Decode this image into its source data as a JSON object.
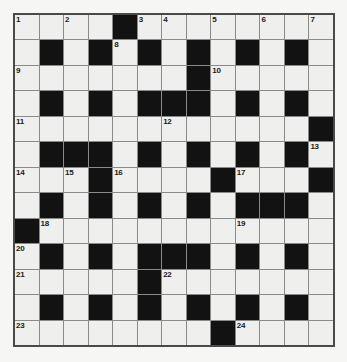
{
  "puzzle": {
    "title": "Crossword Grid",
    "type": "crossword",
    "rows": 13,
    "cols": 13,
    "colors": {
      "page_background": "#f6f6f4",
      "cell_white": "#efefed",
      "cell_block": "#121212",
      "grid_line": "#8a8a8a",
      "grid_border": "#4a4a4a",
      "number_text": "#1a1a1a"
    },
    "grid": [
      [
        "w",
        "w",
        "w",
        "w",
        "b",
        "w",
        "w",
        "w",
        "w",
        "w",
        "w",
        "w",
        "w"
      ],
      [
        "w",
        "b",
        "w",
        "b",
        "w",
        "b",
        "w",
        "b",
        "w",
        "b",
        "w",
        "b",
        "w"
      ],
      [
        "w",
        "w",
        "w",
        "w",
        "w",
        "w",
        "w",
        "b",
        "w",
        "w",
        "w",
        "w",
        "w"
      ],
      [
        "w",
        "b",
        "w",
        "b",
        "w",
        "b",
        "b",
        "b",
        "w",
        "b",
        "w",
        "b",
        "w"
      ],
      [
        "w",
        "w",
        "w",
        "w",
        "w",
        "w",
        "w",
        "w",
        "w",
        "w",
        "w",
        "w",
        "b"
      ],
      [
        "w",
        "b",
        "b",
        "b",
        "w",
        "b",
        "w",
        "b",
        "w",
        "b",
        "w",
        "b",
        "w"
      ],
      [
        "w",
        "w",
        "w",
        "b",
        "w",
        "w",
        "w",
        "w",
        "b",
        "w",
        "w",
        "w",
        "b"
      ],
      [
        "w",
        "b",
        "w",
        "b",
        "w",
        "b",
        "w",
        "b",
        "w",
        "b",
        "b",
        "b",
        "w"
      ],
      [
        "b",
        "w",
        "w",
        "w",
        "w",
        "w",
        "w",
        "w",
        "w",
        "w",
        "w",
        "w",
        "w"
      ],
      [
        "w",
        "b",
        "w",
        "b",
        "w",
        "b",
        "b",
        "b",
        "w",
        "b",
        "w",
        "b",
        "w"
      ],
      [
        "w",
        "w",
        "w",
        "w",
        "w",
        "b",
        "w",
        "w",
        "w",
        "w",
        "w",
        "w",
        "w"
      ],
      [
        "w",
        "b",
        "w",
        "b",
        "w",
        "b",
        "w",
        "b",
        "w",
        "b",
        "w",
        "b",
        "w"
      ],
      [
        "w",
        "w",
        "w",
        "w",
        "w",
        "w",
        "w",
        "w",
        "b",
        "w",
        "w",
        "w",
        "w"
      ]
    ],
    "numbers": [
      {
        "row": 0,
        "col": 0,
        "label": "1"
      },
      {
        "row": 0,
        "col": 2,
        "label": "2"
      },
      {
        "row": 0,
        "col": 5,
        "label": "3"
      },
      {
        "row": 0,
        "col": 6,
        "label": "4"
      },
      {
        "row": 0,
        "col": 8,
        "label": "5"
      },
      {
        "row": 0,
        "col": 10,
        "label": "6"
      },
      {
        "row": 0,
        "col": 12,
        "label": "7"
      },
      {
        "row": 1,
        "col": 4,
        "label": "8"
      },
      {
        "row": 2,
        "col": 0,
        "label": "9"
      },
      {
        "row": 2,
        "col": 8,
        "label": "10"
      },
      {
        "row": 4,
        "col": 0,
        "label": "11"
      },
      {
        "row": 4,
        "col": 6,
        "label": "12"
      },
      {
        "row": 5,
        "col": 12,
        "label": "13"
      },
      {
        "row": 6,
        "col": 0,
        "label": "14"
      },
      {
        "row": 6,
        "col": 2,
        "label": "15"
      },
      {
        "row": 6,
        "col": 4,
        "label": "16"
      },
      {
        "row": 6,
        "col": 9,
        "label": "17"
      },
      {
        "row": 8,
        "col": 1,
        "label": "18"
      },
      {
        "row": 8,
        "col": 9,
        "label": "19"
      },
      {
        "row": 9,
        "col": 0,
        "label": "20"
      },
      {
        "row": 10,
        "col": 0,
        "label": "21"
      },
      {
        "row": 10,
        "col": 6,
        "label": "22"
      },
      {
        "row": 12,
        "col": 0,
        "label": "23"
      },
      {
        "row": 12,
        "col": 9,
        "label": "24"
      }
    ]
  }
}
